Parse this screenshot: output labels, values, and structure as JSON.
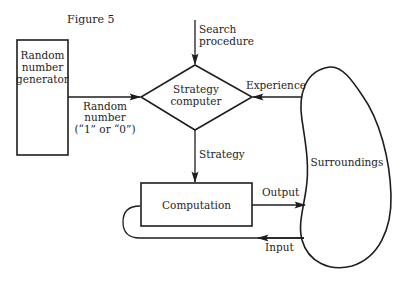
{
  "figure": {
    "title": "Figure 5"
  },
  "nodes": {
    "random_generator": {
      "lines": [
        "Random",
        "number",
        "generator"
      ]
    },
    "strategy_computer": {
      "lines": [
        "Strategy",
        "computer"
      ]
    },
    "computation": {
      "label": "Computation"
    },
    "surroundings": {
      "label": "Surroundings"
    }
  },
  "edges": {
    "search_procedure": {
      "lines": [
        "Search",
        "procedure"
      ]
    },
    "random_number": {
      "lines": [
        "Random",
        "number",
        "(“1” or “0”)"
      ]
    },
    "experience": {
      "label": "Experience"
    },
    "strategy": {
      "label": "Strategy"
    },
    "output": {
      "label": "Output"
    },
    "input": {
      "label": "Input"
    }
  }
}
